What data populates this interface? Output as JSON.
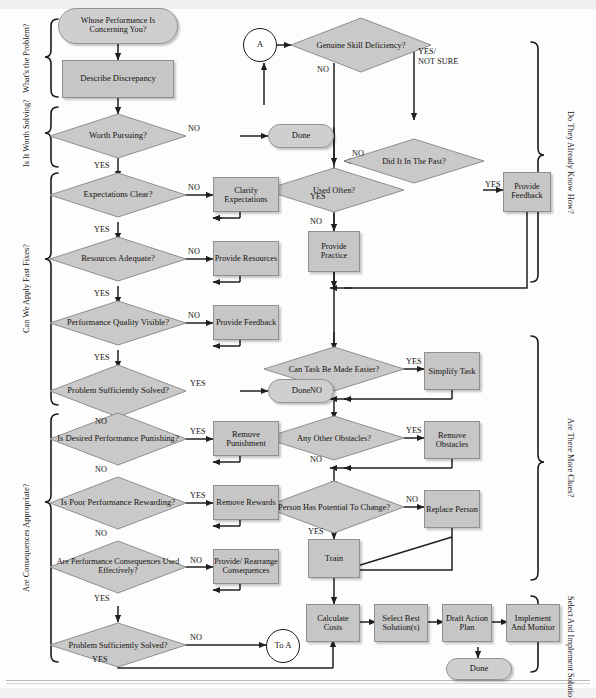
{
  "groups_left": [
    {
      "label": "What's the Problem?"
    },
    {
      "label": "Is It Worth Solving?"
    },
    {
      "label": "Can We Apply Fast Fixes?"
    },
    {
      "label": "Are Consequences Appropriate?"
    }
  ],
  "groups_right": [
    {
      "label": "Do They Already Know How?"
    },
    {
      "label": "Are There More Clues?"
    },
    {
      "label": "Select And Implement Solutions"
    }
  ],
  "nodes": {
    "start": "Whose Performance Is Concerning You?",
    "describe": "Describe Discrepancy",
    "worth": "Worth Pursuing?",
    "done1": "Done",
    "expect": "Expectations Clear?",
    "clarify": "Clarify Expectations",
    "resources": "Resources Adequate?",
    "provide_res": "Provide Resources",
    "quality": "Performance Quality Visible?",
    "provide_fb1": "Provide Feedback",
    "prob1": "Problem Sufficiently Solved?",
    "done2": "Done",
    "punishing": "Is Desired Performance Punishing?",
    "remove_pun": "Remove Punishment",
    "rewarding": "Is Poor Performance Rewarding?",
    "remove_rew": "Remove Rewards",
    "conseq": "Are Performance Consequences Used Effectively?",
    "rearrange": "Provide/ Rearrange Consequences",
    "prob2": "Problem Sufficiently Solved?",
    "to_a": "To A",
    "a": "A",
    "skill": "Genuine Skill Deficiency?",
    "past": "Did It In The Past?",
    "often": "Used Often?",
    "provide_fb2": "Provide Feedback",
    "practice": "Provide Practice",
    "easier": "Can Task Be Made Easier?",
    "simplify": "Simplify Task",
    "obstacles": "Any Other Obstacles?",
    "remove_obs": "Remove Obstacles",
    "potential": "Person Has Potential To Change?",
    "replace": "Replace Person",
    "train": "Train",
    "costs": "Calculate Costs",
    "select": "Select Best Solution(s)",
    "draft": "Draft Action Plan",
    "implement": "Implement And Monitor",
    "done3": "Done"
  },
  "edge_labels": {
    "no": "NO",
    "yes": "YES",
    "yes_notsure_1": "YES/",
    "yes_notsure_2": "NOT SURE"
  },
  "colors": {
    "fill_box": "#c6c6c6",
    "fill_diamond": "#c9c9c9",
    "fill_terminator": "#cfcfcf",
    "stroke": "#8f8f8f",
    "line": "#1f1f1f",
    "text": "#15120f",
    "band": "#efefef"
  }
}
